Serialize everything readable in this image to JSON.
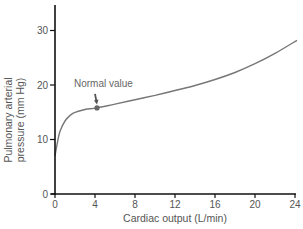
{
  "chart_data": {
    "type": "line",
    "title": "",
    "xlabel": "Cardiac output (L/min)",
    "ylabel_lines": [
      "Pulmonary arterial",
      "pressure (mm Hg)"
    ],
    "ylabel": "Pulmonary arterial pressure (mm Hg)",
    "xlim": [
      0,
      24
    ],
    "ylim": [
      0,
      35
    ],
    "x_ticks": [
      0,
      4,
      8,
      12,
      16,
      20,
      24
    ],
    "y_ticks": [
      0,
      10,
      20,
      30
    ],
    "grid": false,
    "legend": null,
    "series": [
      {
        "name": "Pulmonary arterial pressure",
        "color": "#777777",
        "x": [
          0,
          0.25,
          0.5,
          1,
          1.5,
          2,
          3,
          4.2,
          6,
          8,
          10,
          12,
          14,
          16,
          18,
          20,
          22,
          24.2
        ],
        "y": [
          7,
          9.5,
          11.5,
          13.4,
          14.4,
          15.0,
          15.5,
          15.8,
          16.5,
          17.3,
          18.1,
          19.0,
          19.9,
          21.0,
          22.3,
          23.9,
          25.8,
          28.2
        ]
      }
    ],
    "annotations": [
      {
        "text": "Normal value",
        "x": 4.2,
        "y": 15.8,
        "marker": "dot",
        "arrow": true
      }
    ]
  }
}
